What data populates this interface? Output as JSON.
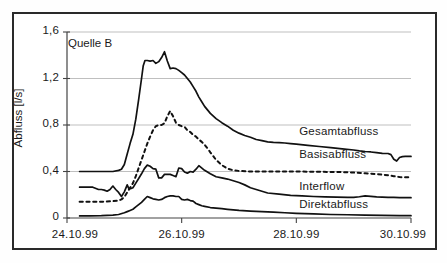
{
  "figure": {
    "annotation": "Quelle B",
    "background_color": "#ffffff",
    "border_color": "#2a2a2a",
    "line_color": "#111111",
    "grid_color": "#b8b8b8"
  },
  "chart_data": {
    "type": "line",
    "title": "",
    "annotation": "Quelle B",
    "xlabel": "",
    "ylabel": "Abfluss [l/s]",
    "xtick_labels": [
      "24.10.99",
      "26.10.99",
      "28.10.99",
      "30.10.99"
    ],
    "xtick_values": [
      0,
      2,
      4,
      6
    ],
    "ytick_labels": [
      "0",
      "0,4",
      "0,8",
      "1,2",
      "1,6"
    ],
    "ytick_values": [
      0,
      0.4,
      0.8,
      1.2,
      1.6
    ],
    "xlim": [
      0,
      6
    ],
    "ylim": [
      0,
      1.6
    ],
    "grid": "horizontal",
    "legend_position": "inline-right",
    "x_unit": "days from 24.10.99",
    "series": [
      {
        "name": "Gesamtabfluss",
        "style": "solid",
        "label_x": 4.05,
        "label_y": 0.73,
        "x": [
          0.22,
          0.4,
          0.6,
          0.8,
          0.9,
          0.95,
          1.0,
          1.05,
          1.1,
          1.15,
          1.2,
          1.25,
          1.3,
          1.33,
          1.36,
          1.4,
          1.45,
          1.5,
          1.55,
          1.6,
          1.65,
          1.7,
          1.75,
          1.8,
          1.85,
          1.9,
          1.95,
          2.0,
          2.05,
          2.1,
          2.15,
          2.2,
          2.25,
          2.3,
          2.35,
          2.4,
          2.45,
          2.5,
          2.6,
          2.7,
          2.8,
          2.9,
          3.0,
          3.1,
          3.2,
          3.3,
          3.4,
          3.5,
          3.6,
          3.7,
          3.8,
          3.9,
          4.0,
          4.2,
          4.4,
          4.6,
          4.8,
          5.0,
          5.1,
          5.2,
          5.3,
          5.4,
          5.5,
          5.6,
          5.65,
          5.7,
          5.75,
          5.8,
          5.85,
          5.9,
          5.95,
          6.0
        ],
        "y": [
          0.4,
          0.4,
          0.4,
          0.4,
          0.41,
          0.42,
          0.46,
          0.55,
          0.64,
          0.72,
          0.85,
          1.02,
          1.2,
          1.31,
          1.355,
          1.355,
          1.35,
          1.355,
          1.33,
          1.345,
          1.38,
          1.43,
          1.35,
          1.285,
          1.29,
          1.285,
          1.27,
          1.25,
          1.23,
          1.2,
          1.17,
          1.13,
          1.09,
          1.04,
          1.0,
          0.96,
          0.93,
          0.9,
          0.855,
          0.82,
          0.79,
          0.755,
          0.73,
          0.71,
          0.695,
          0.675,
          0.665,
          0.655,
          0.65,
          0.648,
          0.645,
          0.64,
          0.635,
          0.625,
          0.615,
          0.605,
          0.595,
          0.585,
          0.578,
          0.572,
          0.568,
          0.562,
          0.556,
          0.555,
          0.545,
          0.505,
          0.49,
          0.52,
          0.528,
          0.53,
          0.53,
          0.53
        ]
      },
      {
        "name": "Basisabfluss",
        "style": "dashed",
        "label_x": 4.05,
        "label_y": 0.53,
        "x": [
          0.22,
          0.4,
          0.6,
          0.8,
          0.9,
          0.95,
          1.0,
          1.05,
          1.1,
          1.15,
          1.2,
          1.25,
          1.3,
          1.35,
          1.4,
          1.45,
          1.5,
          1.55,
          1.6,
          1.65,
          1.7,
          1.75,
          1.8,
          1.85,
          1.9,
          1.95,
          2.0,
          2.05,
          2.1,
          2.15,
          2.2,
          2.25,
          2.3,
          2.35,
          2.4,
          2.45,
          2.5,
          2.6,
          2.7,
          2.8,
          2.9,
          3.0,
          3.2,
          3.4,
          3.6,
          3.8,
          4.0,
          4.3,
          4.6,
          4.9,
          5.2,
          5.4,
          5.6,
          5.7,
          5.8,
          5.9,
          6.0
        ],
        "y": [
          0.14,
          0.14,
          0.14,
          0.145,
          0.15,
          0.16,
          0.18,
          0.22,
          0.26,
          0.3,
          0.36,
          0.43,
          0.5,
          0.57,
          0.64,
          0.7,
          0.755,
          0.79,
          0.8,
          0.8,
          0.815,
          0.875,
          0.92,
          0.875,
          0.82,
          0.8,
          0.79,
          0.785,
          0.755,
          0.74,
          0.715,
          0.7,
          0.675,
          0.655,
          0.63,
          0.6,
          0.565,
          0.5,
          0.455,
          0.425,
          0.41,
          0.405,
          0.4,
          0.4,
          0.4,
          0.4,
          0.4,
          0.398,
          0.396,
          0.394,
          0.385,
          0.378,
          0.368,
          0.36,
          0.352,
          0.35,
          0.35
        ]
      },
      {
        "name": "Interflow",
        "style": "solid",
        "label_x": 4.05,
        "label_y": 0.26,
        "x": [
          0.22,
          0.35,
          0.45,
          0.55,
          0.6,
          0.65,
          0.7,
          0.75,
          0.8,
          0.85,
          0.9,
          0.95,
          1.0,
          1.05,
          1.08,
          1.12,
          1.15,
          1.2,
          1.25,
          1.3,
          1.35,
          1.4,
          1.45,
          1.5,
          1.55,
          1.6,
          1.65,
          1.7,
          1.75,
          1.8,
          1.85,
          1.9,
          1.95,
          2.0,
          2.05,
          2.1,
          2.15,
          2.2,
          2.25,
          2.3,
          2.4,
          2.5,
          2.6,
          2.7,
          2.8,
          2.9,
          3.0,
          3.1,
          3.2,
          3.3,
          3.4,
          3.5,
          3.7,
          3.9,
          4.1,
          4.3,
          4.5,
          4.7,
          4.9,
          5.0,
          5.1,
          5.2,
          5.3,
          5.4,
          5.5,
          5.6,
          5.7,
          5.8,
          5.9,
          6.0
        ],
        "y": [
          0.265,
          0.265,
          0.265,
          0.245,
          0.245,
          0.24,
          0.23,
          0.245,
          0.275,
          0.245,
          0.22,
          0.185,
          0.225,
          0.285,
          0.25,
          0.255,
          0.26,
          0.3,
          0.34,
          0.38,
          0.425,
          0.455,
          0.445,
          0.425,
          0.42,
          0.345,
          0.345,
          0.375,
          0.375,
          0.375,
          0.365,
          0.355,
          0.43,
          0.425,
          0.395,
          0.385,
          0.4,
          0.395,
          0.42,
          0.45,
          0.41,
          0.38,
          0.355,
          0.345,
          0.335,
          0.32,
          0.305,
          0.285,
          0.26,
          0.245,
          0.23,
          0.215,
          0.205,
          0.195,
          0.19,
          0.185,
          0.182,
          0.18,
          0.178,
          0.177,
          0.183,
          0.19,
          0.186,
          0.182,
          0.18,
          0.178,
          0.177,
          0.176,
          0.175,
          0.175
        ]
      },
      {
        "name": "Direktabfluss",
        "style": "solid",
        "label_x": 4.05,
        "label_y": 0.1,
        "x": [
          0.22,
          0.4,
          0.6,
          0.8,
          0.9,
          1.0,
          1.05,
          1.1,
          1.15,
          1.2,
          1.25,
          1.3,
          1.35,
          1.4,
          1.45,
          1.5,
          1.55,
          1.6,
          1.65,
          1.7,
          1.75,
          1.8,
          1.85,
          1.9,
          1.95,
          2.0,
          2.05,
          2.1,
          2.15,
          2.2,
          2.25,
          2.3,
          2.35,
          2.4,
          2.5,
          2.6,
          2.7,
          2.8,
          2.9,
          3.0,
          3.2,
          3.4,
          3.6,
          3.8,
          4.0,
          4.3,
          4.6,
          4.9,
          5.2,
          5.5,
          5.8,
          6.0
        ],
        "y": [
          0.018,
          0.018,
          0.02,
          0.025,
          0.03,
          0.045,
          0.055,
          0.065,
          0.075,
          0.095,
          0.115,
          0.135,
          0.16,
          0.185,
          0.175,
          0.165,
          0.16,
          0.155,
          0.16,
          0.175,
          0.185,
          0.19,
          0.19,
          0.185,
          0.185,
          0.16,
          0.155,
          0.16,
          0.15,
          0.145,
          0.125,
          0.115,
          0.105,
          0.1,
          0.09,
          0.085,
          0.08,
          0.075,
          0.07,
          0.065,
          0.06,
          0.055,
          0.05,
          0.045,
          0.04,
          0.035,
          0.03,
          0.028,
          0.025,
          0.022,
          0.02,
          0.02
        ]
      }
    ]
  }
}
